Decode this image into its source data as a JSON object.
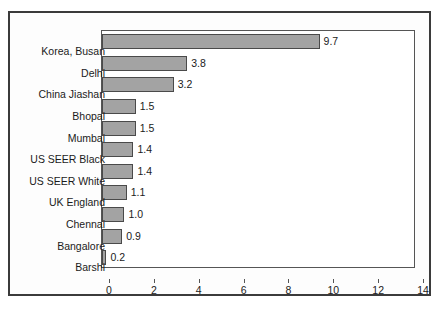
{
  "chart_data": {
    "type": "bar",
    "orientation": "horizontal",
    "title": "",
    "subtitle": "",
    "xlabel": "",
    "ylabel": "",
    "xlim": [
      0,
      14
    ],
    "xticks": [
      0,
      2,
      4,
      6,
      8,
      10,
      12,
      14
    ],
    "xtick_labels": [
      "0",
      "2",
      "4",
      "6",
      "8",
      "10",
      "12",
      "14"
    ],
    "grid": false,
    "legend": null,
    "bar_color": "#a3a3a3",
    "bar_edge_color": "#4a4a4a",
    "plot_background": "#ffffff",
    "figure_background": "#fdfdfd",
    "frame_color": "#3b3b3b",
    "categories": [
      "Korea, Busan",
      "Delhi",
      "China Jiashan",
      "Bhopal",
      "Mumbai",
      "US SEER Black",
      "US SEER White",
      "UK England",
      "Chennai",
      "Bangalore",
      "Barshi"
    ],
    "values": [
      9.7,
      3.8,
      3.2,
      1.5,
      1.5,
      1.4,
      1.4,
      1.1,
      1.0,
      0.9,
      0.2
    ],
    "data_labels": [
      "9.7",
      "3.8",
      "3.2",
      "1.5",
      "1.5",
      "1.4",
      "1.4",
      "1.1",
      "1.0",
      "0.9",
      "0.2"
    ]
  }
}
